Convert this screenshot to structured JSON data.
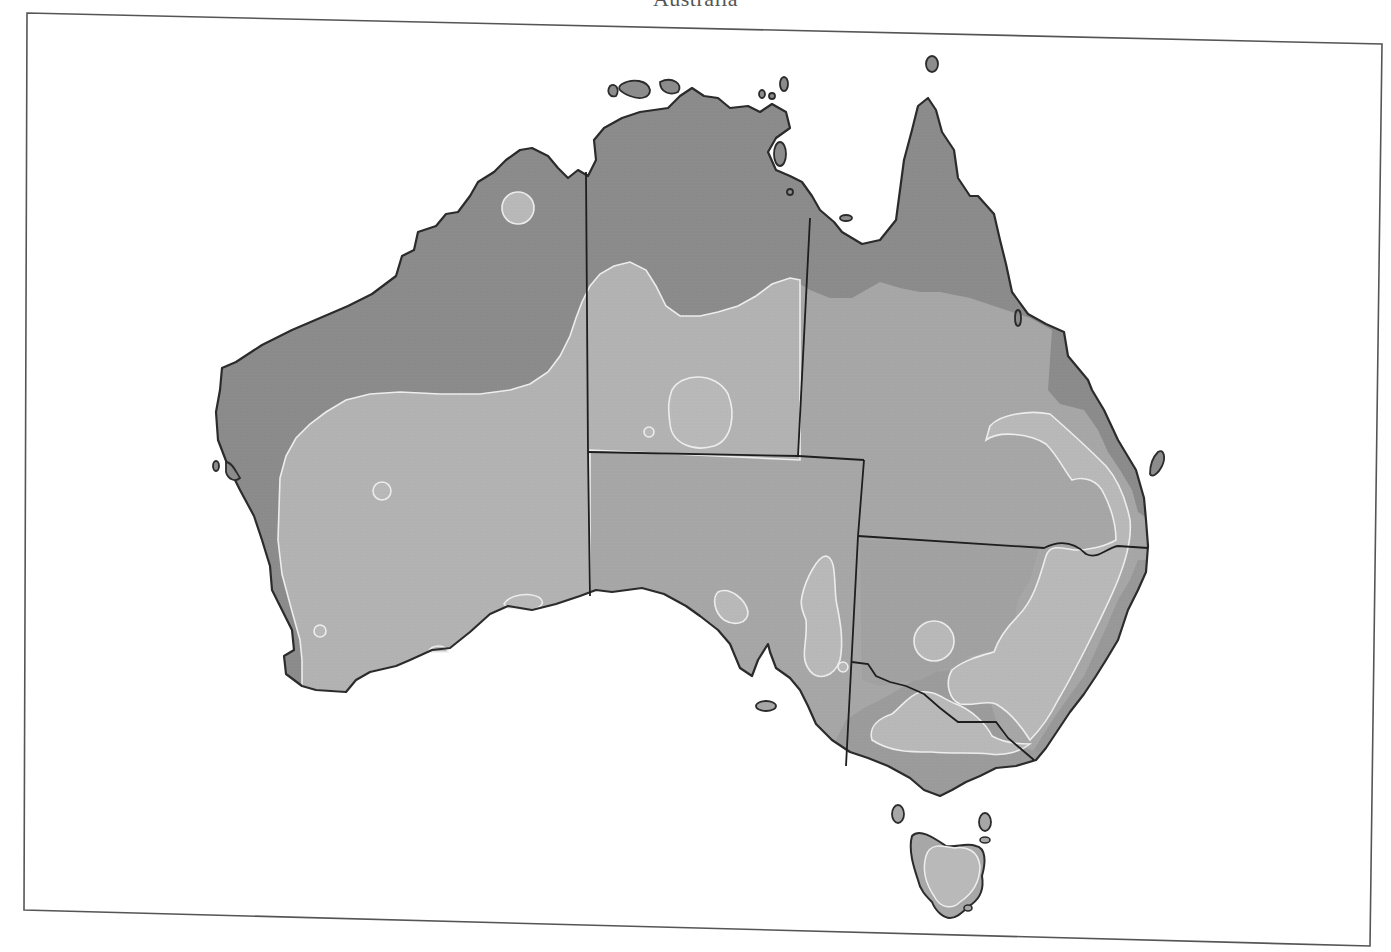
{
  "map": {
    "title": "Australia",
    "colors": {
      "background": "#ffffff",
      "frame": "#444444",
      "coastline": "#2b2b2b",
      "state_border": "#1e1e1e",
      "zone_dark": "#8c8c8c",
      "zone_mid": "#a7a7a7",
      "zone_light": "#b9b9b9",
      "zone_outline": "#eeeeee"
    },
    "zones": [
      {
        "id": "dark",
        "description": "northern and coastal band (darkest shade)"
      },
      {
        "id": "mid",
        "description": "interior (medium shade)"
      },
      {
        "id": "light",
        "description": "isolated lighter patches outlined in white"
      }
    ],
    "regions": [
      "Western Australia",
      "Northern Territory",
      "Queensland",
      "South Australia",
      "New South Wales",
      "Victoria",
      "Tasmania"
    ]
  }
}
